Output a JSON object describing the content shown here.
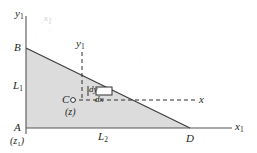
{
  "figure": {
    "type": "geometry-diagram",
    "colors": {
      "ink": "#231f20",
      "triangle_fill": "#dcdcdc",
      "axis": "#4d4d4d",
      "dashed": "#333333",
      "smudge": "#cfcfcf"
    },
    "axes": {
      "vertical_label": "y",
      "vertical_sub": "1",
      "horizontal_label": "x",
      "horizontal_sub": "1"
    },
    "vertices": {
      "top_left": "B",
      "bottom_left": "A",
      "bottom_left_sub": "(z",
      "bottom_left_sub_index": "1",
      "bottom_left_sub_close": ")",
      "bottom_right": "D"
    },
    "segments": {
      "vertical_side": "L",
      "vertical_side_sub": "1",
      "horizontal_side": "L",
      "horizontal_side_sub": "2"
    },
    "interior_point": {
      "name": "C",
      "coordinate": "(z)",
      "marker": "open-circle"
    },
    "coordinate_lines": {
      "vertical_label": "y",
      "vertical_sub": "1",
      "horizontal_label": "x"
    },
    "differential_element": {
      "height_label": "dy",
      "width_label": "dx",
      "shape": "small-rectangle"
    },
    "artifact": {
      "glyph": "x",
      "sub": "1"
    }
  }
}
